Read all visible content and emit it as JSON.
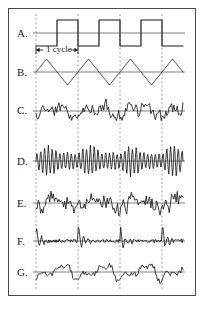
{
  "figure": {
    "background": "#ffffff",
    "frame_color": "#4a4a4a",
    "trace_color": "#1a1a1a",
    "baseline_color": "#808080",
    "gridline_color": "#9a9a9a",
    "annotation": "1 cycle",
    "annotation_left_arrow": "←",
    "annotation_right_arrow": "→"
  },
  "axes": {
    "x_start": 36,
    "x_end": 183,
    "gridlines_x": [
      36,
      78,
      120,
      162
    ],
    "cycle_period_px": 42,
    "n_cycles": 3.5
  },
  "traces": [
    {
      "id": "A",
      "label": "A.",
      "label_x": 17,
      "label_y": 27,
      "baseline_y": 33,
      "amplitude": 13,
      "type": "square",
      "description": "square wave, one cycle per gridline interval"
    },
    {
      "id": "B",
      "label": "B.",
      "label_x": 17,
      "label_y": 66,
      "baseline_y": 72,
      "amplitude": 13,
      "type": "triangle",
      "description": "triangle wave, same period as A"
    },
    {
      "id": "C",
      "label": "C.",
      "label_x": 17,
      "label_y": 104,
      "baseline_y": 111,
      "amplitude": 14,
      "type": "noisy-periodic",
      "harmonics": 7,
      "noise": 0.38,
      "seed": 11,
      "description": "periodic waveform with fine structure"
    },
    {
      "id": "D",
      "label": "D.",
      "label_x": 17,
      "label_y": 155,
      "baseline_y": 161,
      "amplitude": 17,
      "type": "am-oscillation",
      "carrier_cycles": 11,
      "seed": 23,
      "description": "high frequency oscillation, amplitude modulated per cycle"
    },
    {
      "id": "E",
      "label": "E.",
      "label_x": 17,
      "label_y": 197,
      "baseline_y": 203,
      "amplitude": 13,
      "type": "noisy-periodic",
      "harmonics": 9,
      "noise": 0.55,
      "seed": 37,
      "description": "irregular oscillation with periodic envelope"
    },
    {
      "id": "F",
      "label": "F.",
      "label_x": 17,
      "label_y": 235,
      "baseline_y": 241,
      "amplitude": 11,
      "type": "spiky-damped",
      "seed": 51,
      "description": "sharp spike at each cycle onset followed by damped ringing"
    },
    {
      "id": "G",
      "label": "G.",
      "label_x": 17,
      "label_y": 266,
      "baseline_y": 272,
      "amplitude": 12,
      "type": "noisy-periodic",
      "harmonics": 4,
      "noise": 0.22,
      "seed": 67,
      "description": "smooth low frequency periodic waveform"
    }
  ]
}
